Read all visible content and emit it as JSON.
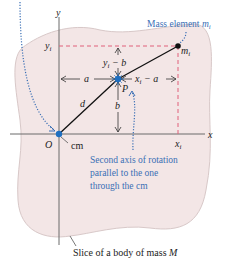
{
  "labels": {
    "y_axis": "y",
    "x_axis": "x",
    "origin": "O",
    "cm": "cm",
    "y_i": "y",
    "y_i_sub": "i",
    "x_i": "x",
    "x_i_sub": "i",
    "a": "a",
    "b": "b",
    "d": "d",
    "P": "P",
    "yi_minus_b_y": "y",
    "yi_minus_b_sub": "i",
    "yi_minus_b_rest": " − b",
    "xi_minus_a_x": "x",
    "xi_minus_a_sub": "i",
    "xi_minus_a_rest": " − a",
    "m_i": "m",
    "m_i_sub": "i",
    "mass_element_text": "Mass element ",
    "mass_element_m": "m",
    "mass_element_sub": "i",
    "second_axis_line1": "Second axis of rotation",
    "second_axis_line2": "parallel to the one",
    "second_axis_line3": "through the cm",
    "slice_text": "Slice of a body of mass ",
    "slice_M": "M"
  },
  "colors": {
    "body_fill": "#f3e6e6",
    "body_stroke": "#d8c8c8",
    "axis": "#6b6b6b",
    "dashed": "#e0607a",
    "point_blue": "#1f6fc0",
    "annotation_blue": "#3a6fb5",
    "text": "#222222"
  }
}
